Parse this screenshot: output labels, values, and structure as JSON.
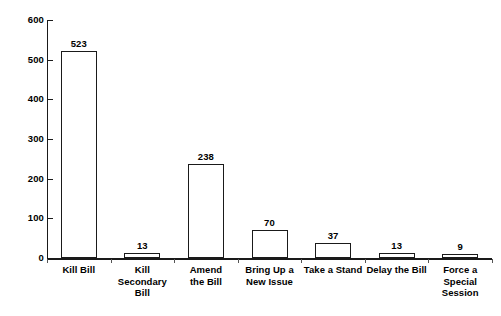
{
  "chart_data": {
    "type": "bar",
    "title": "",
    "subtitle": "",
    "xlabel": "",
    "ylabel": "",
    "ylim": [
      0,
      600
    ],
    "yticks": [
      0,
      100,
      200,
      300,
      400,
      500,
      600
    ],
    "grid": false,
    "legend": null,
    "orientation": "vertical",
    "bar_style": {
      "fill": "#ffffff",
      "outline": "#1a1a1a"
    },
    "categories": [
      "Kill Bill",
      "Kill Secondary\nBill",
      "Amend\nthe Bill",
      "Bring Up a\nNew Issue",
      "Take a Stand",
      "Delay the Bill",
      "Force a\nSpecial\nSession"
    ],
    "values": [
      523,
      13,
      238,
      70,
      37,
      13,
      9
    ],
    "value_labels": [
      "523",
      "13",
      "238",
      "70",
      "37",
      "13",
      "9"
    ],
    "tick_labels": [
      "0",
      "100",
      "200",
      "300",
      "400",
      "500",
      "600"
    ]
  },
  "caption": {
    "faint_bottom_text": ""
  }
}
